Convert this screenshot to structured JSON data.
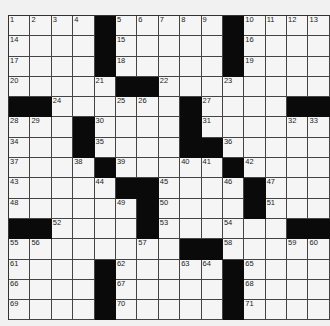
{
  "puzzle": {
    "rows": 15,
    "cols": 15,
    "grid": [
      [
        "1",
        "2",
        "3",
        "4",
        "#",
        "5",
        "6",
        "7",
        "8",
        "9",
        "#",
        "10",
        "11",
        "12",
        "13"
      ],
      [
        "14",
        "",
        "",
        "",
        "#",
        "15",
        "",
        "",
        "",
        "",
        "#",
        "16",
        "",
        "",
        ""
      ],
      [
        "17",
        "",
        "",
        "",
        "#",
        "18",
        "",
        "",
        "",
        "",
        "#",
        "19",
        "",
        "",
        ""
      ],
      [
        "20",
        "",
        "",
        "",
        "21",
        "#",
        "#",
        "22",
        "",
        "",
        "23",
        "",
        "",
        "",
        ""
      ],
      [
        "#",
        "#",
        "24",
        "",
        "",
        "25",
        "26",
        "",
        "#",
        "27",
        "",
        "",
        "",
        "#",
        "#"
      ],
      [
        "28",
        "29",
        "",
        "#",
        "30",
        "",
        "",
        "",
        "#",
        "31",
        "",
        "",
        "",
        "32",
        "33"
      ],
      [
        "34",
        "",
        "",
        "#",
        "35",
        "",
        "",
        "",
        "#",
        "#",
        "36",
        "",
        "",
        "",
        ""
      ],
      [
        "37",
        "",
        "",
        "38",
        "#",
        "39",
        "",
        "",
        "40",
        "41",
        "#",
        "42",
        "",
        "",
        ""
      ],
      [
        "43",
        "",
        "",
        "",
        "44",
        "#",
        "#",
        "45",
        "",
        "",
        "46",
        "#",
        "47",
        "",
        ""
      ],
      [
        "48",
        "",
        "",
        "",
        "",
        "49",
        "#",
        "50",
        "",
        "",
        "",
        "#",
        "51",
        "",
        ""
      ],
      [
        "#",
        "#",
        "52",
        "",
        "",
        "",
        "#",
        "53",
        "",
        "",
        "54",
        "",
        "",
        "#",
        "#"
      ],
      [
        "55",
        "56",
        "",
        "",
        "",
        "",
        "57",
        "",
        "#",
        "#",
        "58",
        "",
        "",
        "59",
        "60"
      ],
      [
        "61",
        "",
        "",
        "",
        "#",
        "62",
        "",
        "",
        "63",
        "64",
        "#",
        "65",
        "",
        "",
        ""
      ],
      [
        "66",
        "",
        "",
        "",
        "#",
        "67",
        "",
        "",
        "",
        "",
        "#",
        "68",
        "",
        "",
        ""
      ],
      [
        "69",
        "",
        "",
        "",
        "#",
        "70",
        "",
        "",
        "",
        "",
        "#",
        "71",
        "",
        "",
        ""
      ]
    ]
  },
  "colors": {
    "black_square": "#0a0a0a",
    "white_square": "#f5f5f5",
    "grid_line": "#444444",
    "background": "#f1f1f1"
  }
}
